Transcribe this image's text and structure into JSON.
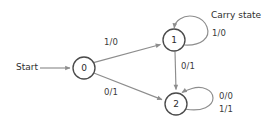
{
  "diagram": {
    "type": "finite-state-machine",
    "title": "",
    "background_color": "#ffffff",
    "node_stroke_color": "#4a4a4a",
    "edge_stroke_color": "#8d8d8d",
    "text_color": "#2e2e2e",
    "start": {
      "label": "Start"
    },
    "annotations": [
      {
        "id": "carry-state",
        "text": "Carry state"
      }
    ],
    "states": [
      {
        "id": "s0",
        "label": "0",
        "cx": 84,
        "cy": 68,
        "r": 11
      },
      {
        "id": "s1",
        "label": "1",
        "cx": 174,
        "cy": 40,
        "r": 11
      },
      {
        "id": "s2",
        "label": "2",
        "cx": 176,
        "cy": 104,
        "r": 11
      }
    ],
    "transitions": [
      {
        "id": "t0to1",
        "from": "0",
        "to": "1",
        "label": "1/0"
      },
      {
        "id": "t0to2",
        "from": "0",
        "to": "2",
        "label": "0/1"
      },
      {
        "id": "t1to2",
        "from": "1",
        "to": "2",
        "label": "0/1"
      },
      {
        "id": "t1self",
        "from": "1",
        "to": "1",
        "label": "1/0"
      },
      {
        "id": "t2self_a",
        "from": "2",
        "to": "2",
        "label": "0/0"
      },
      {
        "id": "t2self_b",
        "from": "2",
        "to": "2",
        "label": "1/1"
      }
    ]
  }
}
